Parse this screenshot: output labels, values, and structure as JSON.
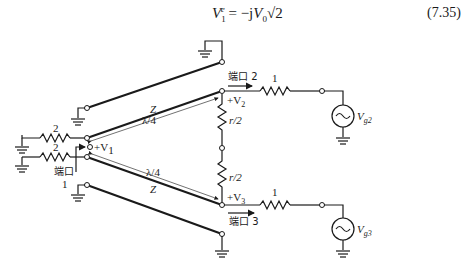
{
  "equation": {
    "lhs": "V",
    "lhs_sub": "1",
    "lhs_sup": "e",
    "rhs_prefix": " = −j",
    "rhs_var": "V",
    "rhs_sub": "0",
    "rhs_root": "√2",
    "number": "(7.35)"
  },
  "diagram": {
    "labels": {
      "z_upper": "Z",
      "lambda_upper": "λ/4",
      "z_lower": "Z",
      "lambda_lower": "λ/4",
      "r_upper": "r/2",
      "r_lower": "r/2",
      "res_left_top": "2",
      "res_left_bottom": "2",
      "res_port2": "1",
      "res_port3": "1",
      "v1": "+V",
      "v1_sub": "1",
      "v2": "+V",
      "v2_sub": "2",
      "v3": "+V",
      "v3_sub": "3",
      "vg2": "V",
      "vg2_sub": "g2",
      "vg3": "V",
      "vg3_sub": "g3",
      "port1": "端口",
      "port1_num": "1",
      "port2": "端口 2",
      "port3": "端口 3"
    }
  }
}
